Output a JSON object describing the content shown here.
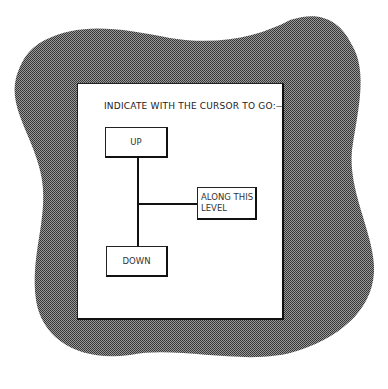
{
  "prompt": "INDICATE WITH THE CURSOR TO GO:—",
  "options": {
    "up": {
      "label": "UP"
    },
    "along": {
      "line1": "ALONG THIS",
      "line2": "LEVEL"
    },
    "down": {
      "label": "DOWN"
    }
  },
  "colors": {
    "frame_fill": "#6a6a6a",
    "panel_bg": "#ffffff",
    "ink": "#111111"
  }
}
